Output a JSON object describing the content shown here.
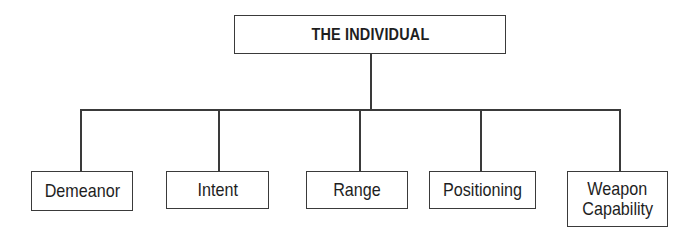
{
  "diagram": {
    "type": "org-tree",
    "root": {
      "label": "THE INDIVIDUAL"
    },
    "children": [
      {
        "label": "Demeanor"
      },
      {
        "label": "Intent"
      },
      {
        "label": "Range"
      },
      {
        "label": "Positioning"
      },
      {
        "label": "Weapon Capability",
        "line1": "Weapon",
        "line2": "Capability"
      }
    ],
    "colors": {
      "line": "#3a3a3a",
      "text": "#1e1e1e",
      "background": "#ffffff"
    }
  }
}
